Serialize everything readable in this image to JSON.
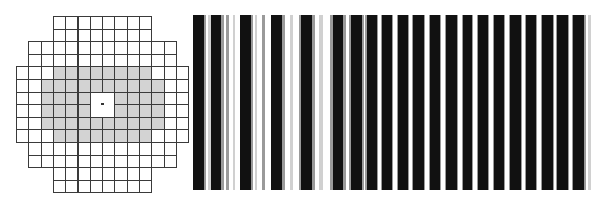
{
  "grid": {
    "origin": {
      "x": 16,
      "y": 16
    },
    "cell_w": 12.3,
    "cell_h": 12.6,
    "rows": [
      {
        "row": 0,
        "col_start": 3,
        "col_end": 10,
        "gray_start": null,
        "gray_end": null
      },
      {
        "row": 1,
        "col_start": 3,
        "col_end": 10,
        "gray_start": null,
        "gray_end": null
      },
      {
        "row": 2,
        "col_start": 1,
        "col_end": 12,
        "gray_start": null,
        "gray_end": null
      },
      {
        "row": 3,
        "col_start": 1,
        "col_end": 12,
        "gray_start": null,
        "gray_end": null
      },
      {
        "row": 4,
        "col_start": 0,
        "col_end": 13,
        "gray_start": 3,
        "gray_end": 10
      },
      {
        "row": 5,
        "col_start": 0,
        "col_end": 13,
        "gray_start": 2,
        "gray_end": 11
      },
      {
        "row": 6,
        "col_start": 0,
        "col_end": 13,
        "gray_start": 2,
        "gray_end": 11
      },
      {
        "row": 7,
        "col_start": 0,
        "col_end": 13,
        "gray_start": 2,
        "gray_end": 11
      },
      {
        "row": 8,
        "col_start": 0,
        "col_end": 13,
        "gray_start": 2,
        "gray_end": 11
      },
      {
        "row": 9,
        "col_start": 0,
        "col_end": 13,
        "gray_start": 3,
        "gray_end": 10
      },
      {
        "row": 10,
        "col_start": 1,
        "col_end": 12,
        "gray_start": null,
        "gray_end": null
      },
      {
        "row": 11,
        "col_start": 1,
        "col_end": 12,
        "gray_start": null,
        "gray_end": null
      },
      {
        "row": 12,
        "col_start": 3,
        "col_end": 10,
        "gray_start": null,
        "gray_end": null
      },
      {
        "row": 13,
        "col_start": 3,
        "col_end": 10,
        "gray_start": null,
        "gray_end": null
      }
    ],
    "center_block": {
      "col": 6,
      "row": 6,
      "span": 2
    },
    "colors": {
      "line": "#3a3a3a",
      "fill": "#ffffff",
      "shaded": "#d3d3d3",
      "dot": "#333333"
    }
  },
  "stripes": {
    "panel": {
      "x": 192,
      "y": 15,
      "w": 400,
      "h": 175
    },
    "colors": {
      "black": "#111111",
      "gray": "#9a9a9a",
      "light": "#d0d0d0",
      "white": "#ffffff"
    },
    "bands": [
      [
        193,
        11,
        "black"
      ],
      [
        204,
        2,
        "gray"
      ],
      [
        208,
        3,
        "light"
      ],
      [
        211,
        10,
        "black"
      ],
      [
        221,
        3,
        "gray"
      ],
      [
        226,
        3,
        "gray"
      ],
      [
        233,
        2,
        "light"
      ],
      [
        240,
        11,
        "black"
      ],
      [
        251,
        2,
        "gray"
      ],
      [
        255,
        2,
        "light"
      ],
      [
        262,
        3,
        "gray"
      ],
      [
        271,
        11,
        "black"
      ],
      [
        282,
        3,
        "gray"
      ],
      [
        290,
        3,
        "light"
      ],
      [
        299,
        2,
        "gray"
      ],
      [
        301,
        11,
        "black"
      ],
      [
        312,
        3,
        "gray"
      ],
      [
        319,
        4,
        "light"
      ],
      [
        330,
        3,
        "gray"
      ],
      [
        333,
        10,
        "black"
      ],
      [
        343,
        3,
        "gray"
      ],
      [
        349,
        2,
        "gray"
      ],
      [
        351,
        11,
        "black"
      ],
      [
        362,
        2,
        "gray"
      ],
      [
        365,
        2,
        "gray"
      ],
      [
        367,
        10,
        "black"
      ],
      [
        377,
        1,
        "gray"
      ],
      [
        381,
        1,
        "gray"
      ],
      [
        382,
        10,
        "black"
      ],
      [
        392,
        1,
        "gray"
      ],
      [
        397,
        1,
        "gray"
      ],
      [
        398,
        10,
        "black"
      ],
      [
        408,
        1,
        "gray"
      ],
      [
        412,
        1,
        "gray"
      ],
      [
        413,
        11,
        "black"
      ],
      [
        424,
        1,
        "gray"
      ],
      [
        429,
        1,
        "gray"
      ],
      [
        430,
        10,
        "black"
      ],
      [
        440,
        1,
        "gray"
      ],
      [
        445,
        1,
        "gray"
      ],
      [
        446,
        11,
        "black"
      ],
      [
        457,
        1,
        "gray"
      ],
      [
        462,
        1,
        "gray"
      ],
      [
        463,
        9,
        "black"
      ],
      [
        472,
        1,
        "gray"
      ],
      [
        477,
        1,
        "gray"
      ],
      [
        478,
        10,
        "black"
      ],
      [
        488,
        1,
        "gray"
      ],
      [
        493,
        1,
        "gray"
      ],
      [
        494,
        10,
        "black"
      ],
      [
        504,
        1,
        "gray"
      ],
      [
        509,
        1,
        "gray"
      ],
      [
        510,
        11,
        "black"
      ],
      [
        521,
        1,
        "gray"
      ],
      [
        525,
        1,
        "gray"
      ],
      [
        526,
        10,
        "black"
      ],
      [
        536,
        1,
        "gray"
      ],
      [
        541,
        1,
        "gray"
      ],
      [
        542,
        11,
        "black"
      ],
      [
        553,
        1,
        "gray"
      ],
      [
        556,
        1,
        "gray"
      ],
      [
        557,
        11,
        "black"
      ],
      [
        568,
        1,
        "gray"
      ],
      [
        572,
        1,
        "gray"
      ],
      [
        573,
        11,
        "black"
      ],
      [
        584,
        2,
        "gray"
      ],
      [
        588,
        3,
        "light"
      ]
    ]
  }
}
